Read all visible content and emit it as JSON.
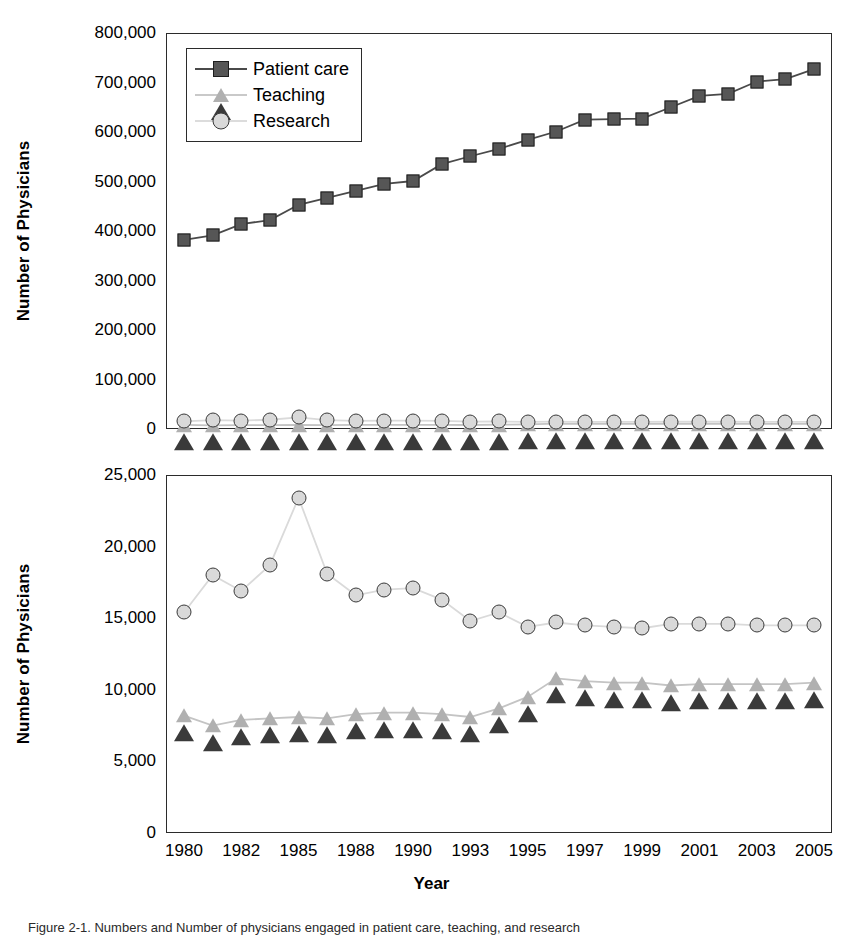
{
  "figure": {
    "caption": "Figure 2-1.  Numbers and Number of physicians engaged in patient care, teaching, and research",
    "axis_titles": {
      "y": "Number of Physicians",
      "x": "Year"
    }
  },
  "legend": {
    "position": "top-left-inside",
    "items": [
      {
        "label": "Patient care",
        "marker": "square-icon",
        "color": "#565656"
      },
      {
        "label": "Teaching",
        "marker": "triangle-icon",
        "color": "#a8a8a8"
      },
      {
        "label": "Research",
        "marker": "circle-icon",
        "color": "#d9d9d9"
      }
    ]
  },
  "chart_data": [
    {
      "id": "top-panel",
      "type": "line",
      "title": "",
      "xlabel": "",
      "ylabel": "Number of Physicians",
      "grid": false,
      "legend_position": "upper left",
      "x": [
        "1980",
        "1981",
        "1982",
        "1983",
        "1984",
        "1985",
        "1986",
        "1987",
        "1988",
        "1989",
        "1990",
        "1991",
        "1992",
        "1993",
        "1994",
        "1995",
        "1996",
        "1997",
        "1998",
        "1999",
        "2000",
        "2001",
        "2002",
        "2003",
        "2004",
        "2005"
      ],
      "xticklabels": [
        "1980",
        "1982",
        "1985",
        "1988",
        "1990",
        "1993",
        "1995",
        "1997",
        "1999",
        "2001",
        "2003",
        "2005"
      ],
      "xtick_indices": [
        0,
        2,
        4,
        6,
        8,
        10,
        12,
        14,
        16,
        18,
        20,
        22
      ],
      "yticklabels": [
        "0",
        "100,000",
        "200,000",
        "300,000",
        "400,000",
        "500,000",
        "600,000",
        "700,000",
        "800,000"
      ],
      "ylim": [
        0,
        800000
      ],
      "ytick_step": 100000,
      "series": [
        {
          "name": "Patient care",
          "marker": "square",
          "values": [
            382000,
            391000,
            414000,
            422000,
            453000,
            467000,
            481000,
            495000,
            501000,
            535000,
            551000,
            566000,
            584000,
            601000,
            625000,
            626000,
            627000,
            650000,
            673000,
            677000,
            702000,
            707000,
            727000
          ]
        },
        {
          "name": "Teaching",
          "marker": "triangle",
          "values": [
            8200,
            7500,
            7900,
            8000,
            8100,
            8000,
            8300,
            8400,
            8400,
            8300,
            8100,
            8700,
            9500,
            10800,
            10600,
            10500,
            10500,
            10300,
            10400,
            10400,
            10400,
            10400,
            10500
          ]
        },
        {
          "name": "Research",
          "marker": "circle",
          "values": [
            15400,
            18000,
            16900,
            18700,
            23400,
            18100,
            16600,
            17000,
            17100,
            16300,
            14800,
            15400,
            14400,
            14700,
            14500,
            14400,
            14300,
            14600,
            14600,
            14600,
            14500,
            14500,
            14500
          ]
        }
      ]
    },
    {
      "id": "bottom-panel",
      "type": "line",
      "title": "",
      "xlabel": "Year",
      "ylabel": "Number of Physicians",
      "grid": false,
      "legend_position": "none",
      "x": [
        "1980",
        "1981",
        "1982",
        "1983",
        "1984",
        "1985",
        "1986",
        "1987",
        "1988",
        "1989",
        "1990",
        "1991",
        "1992",
        "1993",
        "1994",
        "1995",
        "1996",
        "1997",
        "1998",
        "1999",
        "2000",
        "2001",
        "2002",
        "2003",
        "2004",
        "2005"
      ],
      "xticklabels": [
        "1980",
        "1982",
        "1985",
        "1988",
        "1990",
        "1993",
        "1995",
        "1997",
        "1999",
        "2001",
        "2003",
        "2005"
      ],
      "xtick_indices": [
        0,
        2,
        4,
        6,
        8,
        10,
        12,
        14,
        16,
        18,
        20,
        22
      ],
      "yticklabels": [
        "0",
        "5,000",
        "10,000",
        "15,000",
        "20,000",
        "25,000"
      ],
      "ylim": [
        0,
        25000
      ],
      "ytick_step": 5000,
      "series": [
        {
          "name": "Research",
          "marker": "circle",
          "values": [
            15400,
            18000,
            16900,
            18700,
            23400,
            18100,
            16600,
            17000,
            17100,
            16300,
            14800,
            15400,
            14400,
            14700,
            14500,
            14400,
            14300,
            14600,
            14600,
            14600,
            14500,
            14500,
            14500
          ]
        },
        {
          "name": "Teaching",
          "marker": "triangle",
          "values": [
            8200,
            7500,
            7900,
            8000,
            8100,
            8000,
            8300,
            8400,
            8400,
            8300,
            8100,
            8700,
            9500,
            10800,
            10600,
            10500,
            10500,
            10300,
            10400,
            10400,
            10400,
            10400,
            10500
          ]
        }
      ]
    }
  ]
}
